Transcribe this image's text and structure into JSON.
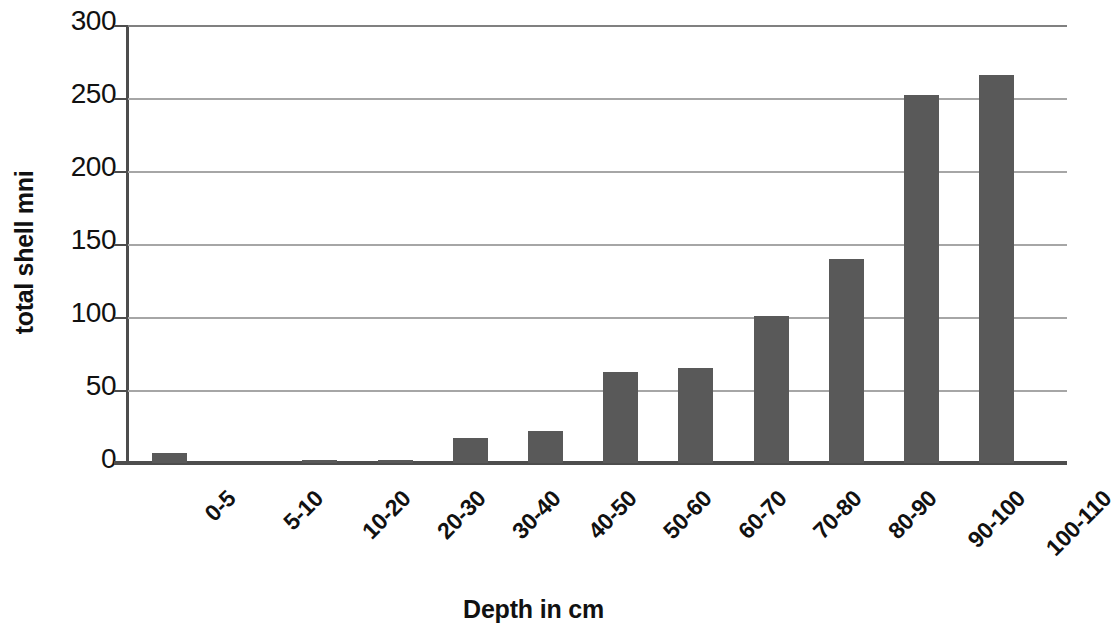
{
  "chart_data": {
    "type": "bar",
    "title": "",
    "xlabel": "Depth in cm",
    "ylabel": "total shell mni",
    "categories": [
      "0-5",
      "5-10",
      "10-20",
      "20-30",
      "30-40",
      "40-50",
      "50-60",
      "60-70",
      "70-80",
      "80-90",
      "90-100",
      "100-110"
    ],
    "values": [
      7,
      0,
      2,
      2,
      17,
      22,
      62,
      65,
      101,
      140,
      252,
      266
    ],
    "series": [
      {
        "name": "total shell mni",
        "values": [
          7,
          0,
          2,
          2,
          17,
          22,
          62,
          65,
          101,
          140,
          252,
          266
        ]
      }
    ],
    "ylim": [
      0,
      300
    ],
    "yticks": [
      0,
      50,
      100,
      150,
      200,
      250,
      300
    ],
    "ytick_labels": [
      "0",
      "50",
      "100",
      "150",
      "200",
      "250",
      "300"
    ],
    "grid": true,
    "grid_axis": "y",
    "legend": false,
    "legend_position": "none",
    "bar_color": "#595959",
    "grid_color": "#a6a6a6",
    "axis_color": "#4d4d4d",
    "text_color": "#111111",
    "background": "#ffffff"
  }
}
